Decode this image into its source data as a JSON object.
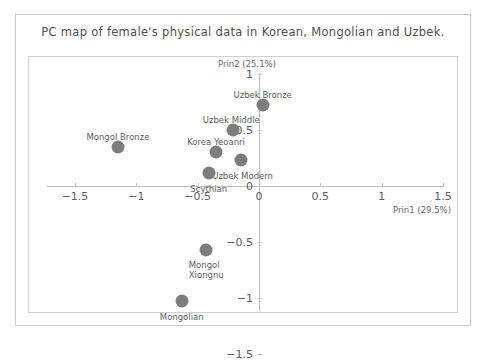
{
  "chart_data": {
    "type": "scatter",
    "title": "PC map of female's physical data in Korean, Mongolian and Uzbek.",
    "xlabel": "Prin1 (29.5%)",
    "ylabel": "Prin2 (25.1%)",
    "xlim": [
      -1.75,
      1.75
    ],
    "ylim": [
      -1.6,
      1.12
    ],
    "grid": false,
    "legend": "none",
    "xticks": [
      {
        "value": -1.5,
        "label": "−1.5"
      },
      {
        "value": -1,
        "label": "−1"
      },
      {
        "value": -0.5,
        "label": "−0.5"
      },
      {
        "value": 0,
        "label": "0"
      },
      {
        "value": 0.5,
        "label": "0.5"
      },
      {
        "value": 1,
        "label": "1"
      },
      {
        "value": 1.5,
        "label": "1.5"
      }
    ],
    "yticks": [
      {
        "value": 1,
        "label": "1"
      },
      {
        "value": 0.5,
        "label": "0.5"
      },
      {
        "value": 0,
        "label": "0"
      },
      {
        "value": -0.5,
        "label": "−0.5"
      },
      {
        "value": -1,
        "label": "−1"
      },
      {
        "value": -1.5,
        "label": "−1.5"
      }
    ],
    "marker_color": "#7d7d7d",
    "points": [
      {
        "name": "Uzbek Bronze",
        "label": "Uzbek Bronze",
        "x": 0.03,
        "y": 0.72,
        "label_dx": 0,
        "label_dy": -13,
        "anchor": "center"
      },
      {
        "name": "Uzbek Middle",
        "label": "Uzbek Middle",
        "x": -0.21,
        "y": 0.5,
        "label_dx": -2,
        "label_dy": -13,
        "anchor": "center"
      },
      {
        "name": "Korea Yeoanri",
        "label": "Korea Yeoanri",
        "x": -0.35,
        "y": 0.3,
        "label_dx": 0,
        "label_dy": -13,
        "anchor": "center"
      },
      {
        "name": "Uzbek Modern",
        "label": "Uzbek Modern",
        "x": -0.15,
        "y": 0.23,
        "label_dx": 2,
        "label_dy": 14,
        "anchor": "center"
      },
      {
        "name": "Scythian",
        "label": "Scythian",
        "x": -0.41,
        "y": 0.12,
        "label_dx": 0,
        "label_dy": 14,
        "anchor": "center"
      },
      {
        "name": "Mongol Bronze",
        "label": "Mongol Bronze",
        "x": -1.15,
        "y": 0.35,
        "label_dx": 0,
        "label_dy": -13,
        "anchor": "center"
      },
      {
        "name": "Mongol Xiongnu",
        "label": "Mongol\nXiongnu",
        "x": -0.43,
        "y": -0.57,
        "label_dx": 0,
        "label_dy": 13,
        "anchor": "center"
      },
      {
        "name": "Mongolian",
        "label": "Mongolian",
        "x": -0.63,
        "y": -1.03,
        "label_dx": 0,
        "label_dy": 14,
        "anchor": "center"
      }
    ]
  }
}
